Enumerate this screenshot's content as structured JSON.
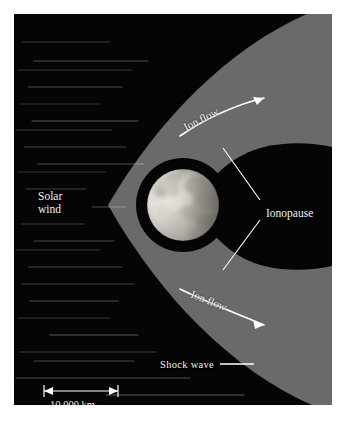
{
  "figure": {
    "background_color": "#050505",
    "shock_region_color": "#6a6a6a",
    "margin_color": "#ffffff",
    "label_color": "#f2f2f2"
  },
  "labels": {
    "solar_wind": "Solar\nwind",
    "ion_flow_upper": "Ion flow",
    "ion_flow_lower": "Ion flow",
    "ionopause": "Ionopause",
    "shock_wave": "Shock wave",
    "scale_bar": "10,000 km"
  },
  "scale": {
    "value": "10,000 km",
    "bar_left_px": 30,
    "bar_right_px": 104,
    "bar_y_px": 377
  },
  "planet": {
    "name": "venus-disk",
    "center_x": 169,
    "center_y": 191,
    "radius": 36,
    "terminator": "bright western limb, darker eastern half"
  },
  "regions": [
    {
      "name": "solar-wind-region",
      "description": "streaked dark region at left"
    },
    {
      "name": "shock-sheath-region",
      "description": "gray parabolic magnetosheath"
    },
    {
      "name": "ionopause-tail-region",
      "description": "dark cavity and tail behind planet"
    }
  ],
  "streak_count": 42
}
